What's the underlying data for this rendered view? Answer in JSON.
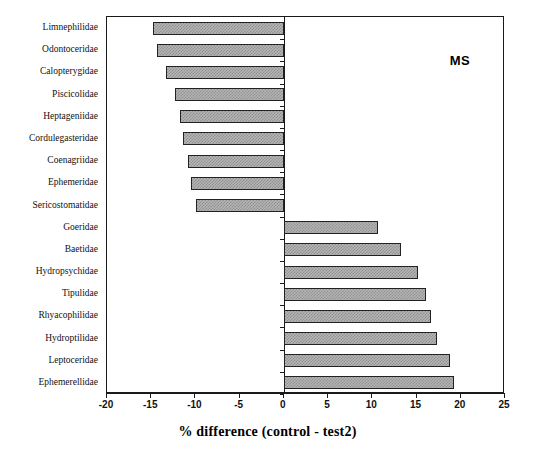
{
  "chart_data": {
    "type": "bar",
    "orientation": "horizontal",
    "title": "",
    "xlabel": "% difference (control - test2)",
    "ylabel": "",
    "xlim": [
      -20,
      25
    ],
    "xticks": [
      -20,
      -15,
      -10,
      -5,
      0,
      5,
      10,
      15,
      20,
      25
    ],
    "xticklabels": [
      "-20",
      "-15",
      "-10",
      "-5",
      "0",
      "5",
      "10",
      "15",
      "20",
      "25"
    ],
    "grid": false,
    "legend": false,
    "annotations": [
      {
        "text": "MS",
        "x": 20,
        "y_index": 1
      }
    ],
    "categories": [
      "Limnephilidae",
      "Odontoceridae",
      "Calopterygidae",
      "Piscicolidae",
      "Heptageniidae",
      "Cordulegasteridae",
      "Coenagriidae",
      "Ephemeridae",
      "Sericostomatidae",
      "Goeridae",
      "Baetidae",
      "Hydropsychidae",
      "Tipulidae",
      "Rhyacophilidae",
      "Hydroptilidae",
      "Leptoceridae",
      "Ephemerellidae"
    ],
    "values": [
      -14.8,
      -14.3,
      -13.3,
      -12.3,
      -11.8,
      -11.4,
      -10.8,
      -10.5,
      -9.9,
      10.6,
      13.2,
      15.2,
      16.1,
      16.6,
      17.3,
      18.8,
      19.2
    ],
    "bar_fill": "#b5b5b5",
    "bar_edge": "#222222",
    "axis_color": "#1a1a1a",
    "background": "#ffffff"
  }
}
